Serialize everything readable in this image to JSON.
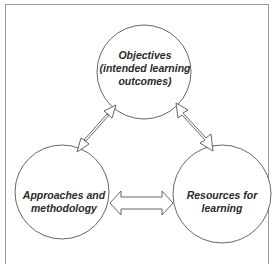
{
  "diagram": {
    "nodes": [
      {
        "id": "objectives",
        "lines": [
          "Objectives",
          "(intended learning",
          "outcomes)"
        ]
      },
      {
        "id": "approaches",
        "lines": [
          "Approaches and",
          "methodology"
        ]
      },
      {
        "id": "resources",
        "lines": [
          "Resources for",
          "learning"
        ]
      }
    ],
    "edges": [
      {
        "from": "objectives",
        "to": "approaches",
        "type": "double-arrow"
      },
      {
        "from": "objectives",
        "to": "resources",
        "type": "double-arrow"
      },
      {
        "from": "approaches",
        "to": "resources",
        "type": "double-arrow"
      }
    ],
    "colors": {
      "stroke": "#555555",
      "frame": "#9a9a9a",
      "text": "#2a2a2a"
    }
  }
}
